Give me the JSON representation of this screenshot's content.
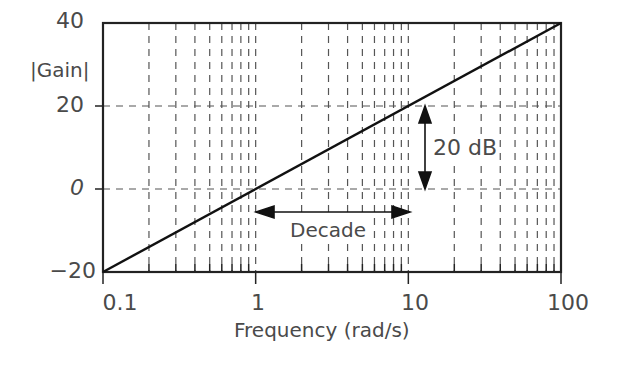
{
  "chart_data": {
    "type": "line",
    "title": "",
    "xlabel": "Frequency (rad/s)",
    "ylabel": "|Gain|",
    "xscale": "log",
    "xlim": [
      0.1,
      100
    ],
    "ylim": [
      -20,
      40
    ],
    "xticks": [
      "0.1",
      "1",
      "10",
      "100"
    ],
    "yticks": [
      "-20",
      "0",
      "20",
      "40"
    ],
    "grid": "dashed, log minor verticals",
    "series": [
      {
        "name": "Gain",
        "x": [
          0.1,
          1,
          10,
          100
        ],
        "y": [
          -20,
          0,
          20,
          40
        ]
      }
    ],
    "annotations": [
      {
        "text": "20 dB",
        "type": "vertical double arrow",
        "from": 0,
        "to": 20,
        "at_x": 12.5
      },
      {
        "text": "Decade",
        "type": "horizontal double arrow",
        "from": 1,
        "to": 10,
        "at_y": -6
      }
    ]
  },
  "labels": {
    "ylabel": "|Gain|",
    "xlabel": "Frequency (rad/s)",
    "y40": "40",
    "y20": "20",
    "y0": "0",
    "yneg20": "−20",
    "x01": "0.1",
    "x1": "1",
    "x10": "10",
    "x100": "100",
    "db_annot": "20 dB",
    "decade_annot": "Decade"
  }
}
